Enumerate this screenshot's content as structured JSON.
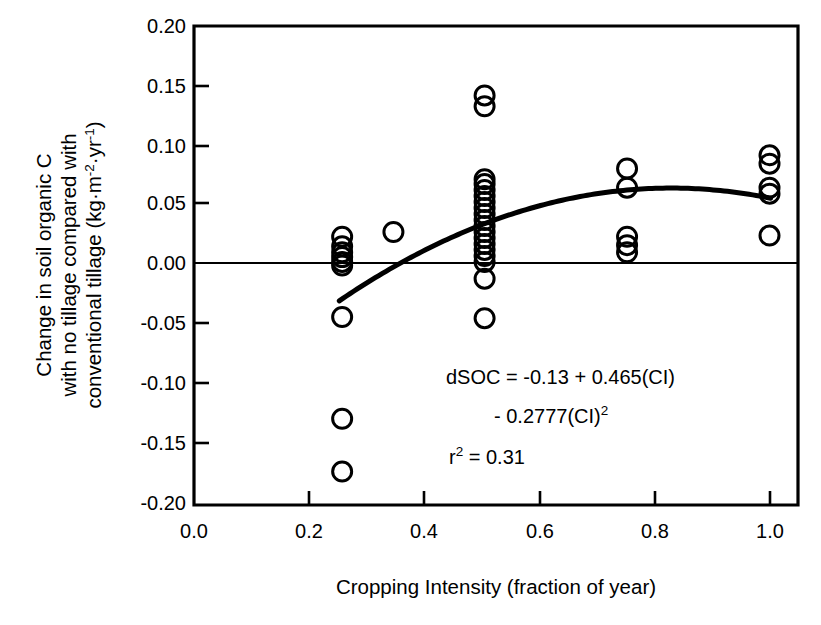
{
  "chart_data": {
    "type": "scatter",
    "title": "",
    "xlabel": "Cropping Intensity (fraction of year)",
    "ylabel_lines": [
      "Change in soil organic C",
      "with no tillage compared with",
      "conventional tillage (kg·m⁻²·yr⁻¹)"
    ],
    "xlim": [
      0.0,
      1.06
    ],
    "ylim": [
      -0.2,
      0.2
    ],
    "xticks": [
      0.0,
      0.2,
      0.4,
      0.6,
      0.8,
      1.0
    ],
    "xticklabels": [
      "0.0",
      "0.2",
      "0.4",
      "0.6",
      "0.8",
      "1.0"
    ],
    "yticks": [
      0.2,
      0.15,
      0.1,
      0.05,
      0.0,
      -0.05,
      -0.1,
      -0.15,
      -0.2
    ],
    "yticklabels": [
      "0.20",
      "0.15",
      "0.10",
      "0.05",
      "0.00",
      "-0.05",
      "-0.10",
      "-0.15",
      "-0.20"
    ],
    "grid": false,
    "legend": "none",
    "marker": "open-circle",
    "zero_reference_line": 0.0,
    "points": [
      {
        "x": 0.26,
        "y": 0.024
      },
      {
        "x": 0.26,
        "y": 0.016
      },
      {
        "x": 0.26,
        "y": 0.011
      },
      {
        "x": 0.26,
        "y": 0.007
      },
      {
        "x": 0.26,
        "y": 0.003
      },
      {
        "x": 0.26,
        "y": 0.0
      },
      {
        "x": 0.26,
        "y": -0.043
      },
      {
        "x": 0.26,
        "y": -0.128
      },
      {
        "x": 0.26,
        "y": -0.172
      },
      {
        "x": 0.35,
        "y": 0.028
      },
      {
        "x": 0.51,
        "y": 0.142
      },
      {
        "x": 0.51,
        "y": 0.133
      },
      {
        "x": 0.51,
        "y": 0.072
      },
      {
        "x": 0.51,
        "y": 0.068
      },
      {
        "x": 0.51,
        "y": 0.063
      },
      {
        "x": 0.51,
        "y": 0.058
      },
      {
        "x": 0.51,
        "y": 0.053
      },
      {
        "x": 0.51,
        "y": 0.048
      },
      {
        "x": 0.51,
        "y": 0.043
      },
      {
        "x": 0.51,
        "y": 0.038
      },
      {
        "x": 0.51,
        "y": 0.033
      },
      {
        "x": 0.51,
        "y": 0.028
      },
      {
        "x": 0.51,
        "y": 0.023
      },
      {
        "x": 0.51,
        "y": 0.018
      },
      {
        "x": 0.51,
        "y": 0.013
      },
      {
        "x": 0.51,
        "y": 0.008
      },
      {
        "x": 0.51,
        "y": 0.003
      },
      {
        "x": 0.51,
        "y": -0.011
      },
      {
        "x": 0.51,
        "y": -0.044
      },
      {
        "x": 0.76,
        "y": 0.081
      },
      {
        "x": 0.76,
        "y": 0.065
      },
      {
        "x": 0.76,
        "y": 0.024
      },
      {
        "x": 0.76,
        "y": 0.017
      },
      {
        "x": 0.76,
        "y": 0.011
      },
      {
        "x": 1.01,
        "y": 0.092
      },
      {
        "x": 1.01,
        "y": 0.085
      },
      {
        "x": 1.01,
        "y": 0.065
      },
      {
        "x": 1.01,
        "y": 0.06
      },
      {
        "x": 1.01,
        "y": 0.025
      }
    ],
    "fit_curve": {
      "kind": "quadratic",
      "intercept": -0.13,
      "linear_coef": 0.465,
      "quadratic_coef": -0.2777,
      "x_start": 0.255,
      "x_end": 1.012
    }
  },
  "annotation": {
    "line1": "dSOC = -0.13 + 0.465(CI)",
    "line2_prefix": "- 0.2777(CI)",
    "line2_sup": "2",
    "line3_prefix": "r",
    "line3_sup": "2",
    "line3_suffix": " = 0.31"
  },
  "ylabel": {
    "line1": "Change in soil organic C",
    "line2": "with no tillage compared with",
    "line3_plain": "conventional tillage (kg·m",
    "line3_sup1": "-2",
    "line3_mid": "·yr",
    "line3_sup2": "-1",
    "line3_end": ")"
  },
  "xlabel": "Cropping Intensity (fraction of year)"
}
